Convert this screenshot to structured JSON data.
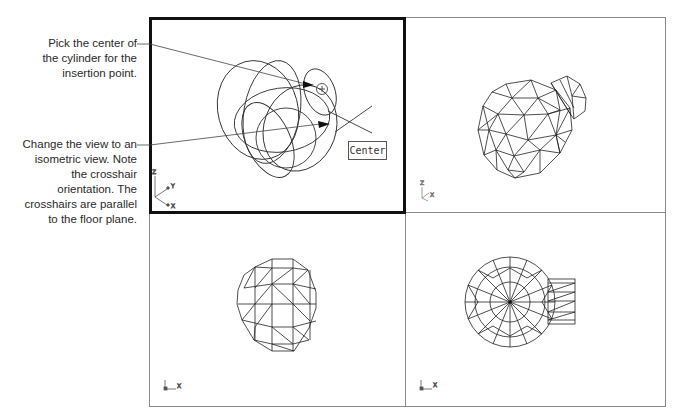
{
  "callouts": [
    {
      "id": "insertion-point",
      "lines": [
        "Pick the center of",
        "the cylinder for the",
        "insertion point."
      ]
    },
    {
      "id": "isometric-view",
      "lines": [
        "Change the view to an",
        "isometric view. Note",
        "the crosshair",
        "orientation. The",
        "crosshairs are parallel",
        "to the floor plane."
      ]
    }
  ],
  "viewports": [
    {
      "position": "top-left",
      "active": true,
      "view": "isometric (ellipse wireframe, insertion in progress)",
      "ucs_labels": [
        "Z",
        "Y",
        "X"
      ]
    },
    {
      "position": "top-right",
      "active": false,
      "view": "isometric wireframe mesh sphere with cylinder",
      "ucs_labels": [
        "Z",
        "X"
      ]
    },
    {
      "position": "bottom-left",
      "active": false,
      "view": "front wireframe mesh sphere",
      "ucs_labels": [
        "X"
      ]
    },
    {
      "position": "bottom-right",
      "active": false,
      "view": "top wireframe mesh sphere with cylinder",
      "ucs_labels": [
        "X"
      ]
    }
  ],
  "tooltip": {
    "label": "Center"
  },
  "colors": {
    "active_border": "#111111",
    "viewport_border": "#8a8a8a",
    "linework": "#222222"
  }
}
